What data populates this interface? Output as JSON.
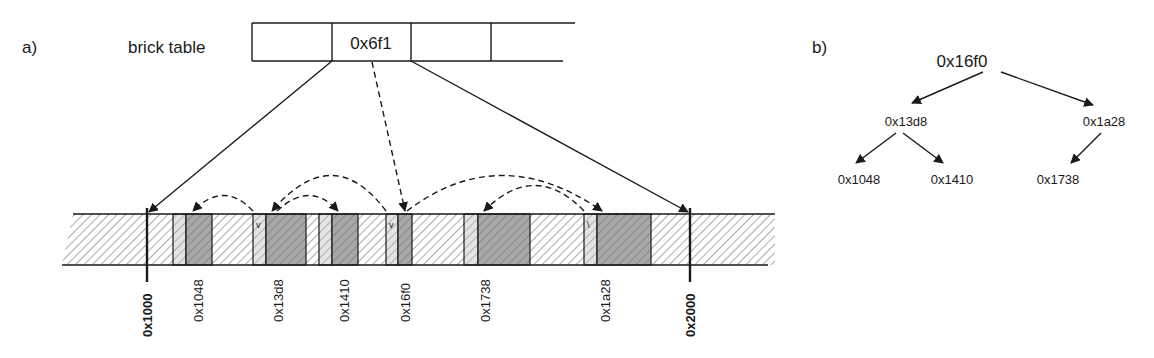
{
  "panel_a": {
    "label": "a)",
    "brick_table": {
      "label": "brick table",
      "cells": [
        "",
        "0x6f1",
        "",
        ""
      ],
      "highlighted_value": "0x6f1"
    },
    "memory_bounds": {
      "start": "0x1000",
      "end": "0x2000"
    },
    "node_addresses": [
      "0x1048",
      "0x13d8",
      "0x1410",
      "0x16f0",
      "0x1738",
      "0x1a28"
    ]
  },
  "panel_b": {
    "label": "b)",
    "tree": {
      "root": "0x16f0",
      "left": "0x13d8",
      "right": "0x1a28",
      "left_left": "0x1048",
      "left_right": "0x1410",
      "right_left": "0x1738"
    }
  },
  "colors": {
    "stroke": "#1a1a1a",
    "hatch_light": "#f2f2f2",
    "hatch_dark": "#a8a8a8"
  }
}
